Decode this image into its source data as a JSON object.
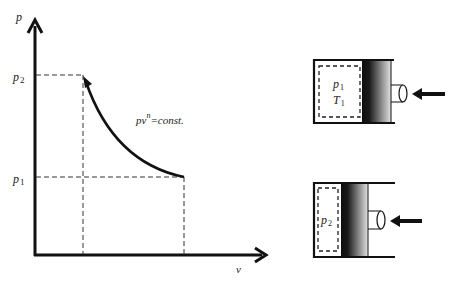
{
  "diagram": {
    "pv_chart": {
      "y_axis_label": "p",
      "x_axis_label": "v",
      "p2_label": "p",
      "p2_sub": "2",
      "p1_label": "p",
      "p1_sub": "1",
      "equation_prefix": "pv",
      "equation_exponent": "n",
      "equation_suffix": "=const.",
      "process": "polytropic compression from state 1 to state 2"
    },
    "cylinder_initial": {
      "pressure_label": "p",
      "pressure_sub": "1",
      "temperature_label": "T",
      "temperature_sub": "1"
    },
    "cylinder_compressed": {
      "pressure_label": "p",
      "pressure_sub": "2"
    },
    "colors": {
      "line": "#111111",
      "piston_dark": "#1a1a1a",
      "piston_light": "#d8d8d8"
    }
  }
}
